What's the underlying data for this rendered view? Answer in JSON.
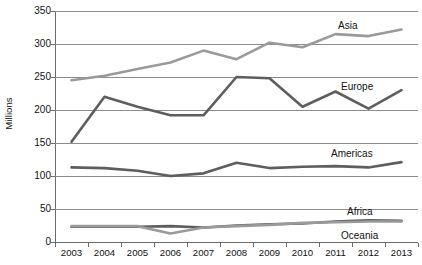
{
  "chart_data": {
    "type": "line",
    "title": "",
    "xlabel": "",
    "ylabel": "Millions",
    "ylim": [
      0,
      350
    ],
    "ytick_step": 50,
    "yticks": [
      "0",
      "50",
      "100",
      "150",
      "200",
      "250",
      "300",
      "350"
    ],
    "grid": true,
    "legend": "direct-labels-right",
    "categories": [
      "2003",
      "2004",
      "2005",
      "2006",
      "2007",
      "2008",
      "2009",
      "2010",
      "2011",
      "2012",
      "2013"
    ],
    "series": [
      {
        "name": "Asia",
        "color": "#9a9a9a",
        "values": [
          245,
          252,
          262,
          272,
          290,
          277,
          302,
          295,
          315,
          312,
          322
        ]
      },
      {
        "name": "Europe",
        "color": "#5e5e5e",
        "values": [
          152,
          220,
          205,
          192,
          192,
          250,
          248,
          205,
          228,
          202,
          230
        ]
      },
      {
        "name": "Americas",
        "color": "#5e5e5e",
        "values": [
          113,
          112,
          108,
          100,
          104,
          120,
          112,
          114,
          115,
          113,
          121
        ]
      },
      {
        "name": "Africa",
        "color": "#5e5e5e",
        "values": [
          23,
          23,
          23,
          24,
          22,
          25,
          27,
          28,
          31,
          33,
          32
        ]
      },
      {
        "name": "Oceania",
        "color": "#9a9a9a",
        "values": [
          24,
          24,
          24,
          13,
          22,
          24,
          26,
          29,
          30,
          31,
          31
        ]
      }
    ],
    "series_labels": [
      {
        "name": "Asia",
        "x": 338,
        "y": 20
      },
      {
        "name": "Europe",
        "x": 341,
        "y": 81
      },
      {
        "name": "Americas",
        "x": 331,
        "y": 148
      },
      {
        "name": "Africa",
        "x": 347,
        "y": 206
      },
      {
        "name": "Oceania",
        "x": 341,
        "y": 230
      }
    ]
  }
}
